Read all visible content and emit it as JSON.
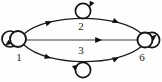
{
  "diagram": {
    "type": "directed-graph",
    "background_color": "#fefefe",
    "stroke_color": "#151515",
    "label_color": "#1a1a1a",
    "nodes": [
      {
        "id": "1",
        "label": "1",
        "x": 18,
        "y": 39,
        "r": 8,
        "label_x": 19,
        "label_y": 58,
        "self_loop": "left"
      },
      {
        "id": "2",
        "label": "2",
        "x": 83,
        "y": 24,
        "r": 0,
        "label_x": 81,
        "label_y": 27,
        "self_loop": "top"
      },
      {
        "id": "3",
        "label": "3",
        "x": 83,
        "y": 57,
        "r": 0,
        "label_x": 81,
        "label_y": 51,
        "self_loop": "bottom"
      },
      {
        "id": "6",
        "label": "6",
        "x": 145,
        "y": 40,
        "r": 7.5,
        "label_x": 142,
        "label_y": 58,
        "self_loop": "right"
      }
    ],
    "self_loops": [
      {
        "node": "1",
        "cx": 10,
        "cy": 39,
        "r": 8.0,
        "arrow_angle": 200
      },
      {
        "node": "2",
        "cx": 83,
        "cy": 10,
        "r": 7.5,
        "arrow_angle": 30
      },
      {
        "node": "3",
        "cx": 83,
        "cy": 70,
        "r": 7.5,
        "arrow_angle": 260
      },
      {
        "node": "6",
        "cx": 152,
        "cy": 40,
        "r": 7.5,
        "arrow_angle": 20
      }
    ],
    "edges": [
      {
        "from": "1",
        "to": "6",
        "via": "2",
        "style": "curve-upper-outer",
        "arrow_at": 0.34,
        "label": "2"
      },
      {
        "from": "1",
        "to": "6",
        "via": "2",
        "style": "curve-upper-inner",
        "arrow_at": 0.74,
        "label": "2"
      },
      {
        "from": "1",
        "to": "6",
        "via": "",
        "style": "straight-middle",
        "arrow_at": 0.66,
        "label": ""
      },
      {
        "from": "1",
        "to": "6",
        "via": "3",
        "style": "curve-lower-outer",
        "arrow_at": 0.34,
        "label": "3"
      },
      {
        "from": "1",
        "to": "6",
        "via": "3",
        "style": "curve-lower-inner",
        "arrow_at": 0.72,
        "label": "3"
      }
    ],
    "edge_count": 5,
    "node_count": 4
  }
}
